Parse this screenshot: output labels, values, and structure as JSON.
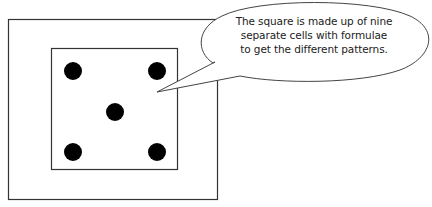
{
  "diagram": {
    "outer_frame": {
      "x": 8,
      "y": 19,
      "width": 210,
      "height": 181
    },
    "inner_square": {
      "x": 51,
      "y": 48,
      "width": 127,
      "height": 122
    },
    "dots": [
      {
        "cx": 73,
        "cy": 71
      },
      {
        "cx": 157,
        "cy": 71
      },
      {
        "cx": 115,
        "cy": 112
      },
      {
        "cx": 73,
        "cy": 152
      },
      {
        "cx": 157,
        "cy": 152
      }
    ],
    "dot_radius": 9,
    "colors": {
      "line": "#333333",
      "dot": "#000000",
      "background": "#ffffff"
    }
  },
  "callout": {
    "lines": [
      "The square is made up of nine",
      "separate cells with formulae",
      "to get the different patterns."
    ]
  }
}
